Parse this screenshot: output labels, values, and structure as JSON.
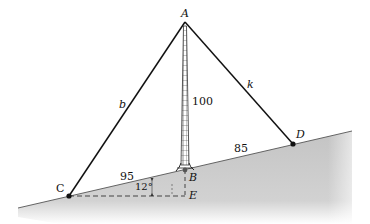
{
  "diagram": {
    "type": "geometry-figure",
    "points": {
      "A": {
        "label": "A",
        "x": 185,
        "y": 22
      },
      "B": {
        "label": "B",
        "x": 185,
        "y": 170
      },
      "C": {
        "label": "C",
        "x": 69,
        "y": 196
      },
      "D": {
        "label": "D",
        "x": 293,
        "y": 144
      },
      "E": {
        "label": "E",
        "x": 185,
        "y": 196
      }
    },
    "segment_labels": {
      "AC": "b",
      "AD": "k",
      "AB": "100",
      "CB": "95",
      "BD": "85"
    },
    "angle_label": "12°",
    "colors": {
      "line": "#111111",
      "ground_fill": "#c8c8c8",
      "ground_edge": "#555555",
      "tower": "#333333"
    }
  }
}
